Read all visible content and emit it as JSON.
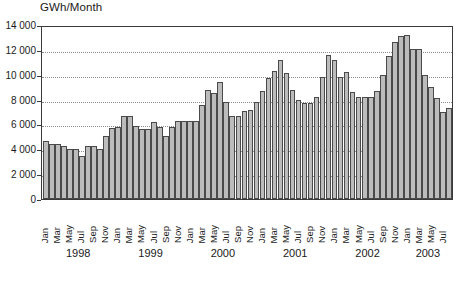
{
  "chart_data": {
    "type": "bar",
    "title": "GWh/Month",
    "xlabel": "",
    "ylabel": "GWh/Month",
    "ylim": [
      0,
      14000
    ],
    "grid": true,
    "legend": null,
    "y_ticks": [
      0,
      2000,
      4000,
      6000,
      8000,
      10000,
      12000,
      14000
    ],
    "y_tick_labels": [
      "0",
      "2 000",
      "4 000",
      "6 000",
      "8 000",
      "10 000",
      "12 000",
      "14 000"
    ],
    "year_labels": [
      "1998",
      "1999",
      "2000",
      "2001",
      "2002",
      "2003"
    ],
    "visible_month_ticks": [
      "Jan",
      "Mar",
      "May",
      "Jul",
      "Sep",
      "Nov"
    ],
    "categories": [
      "Jan 1998",
      "Feb 1998",
      "Mar 1998",
      "Apr 1998",
      "May 1998",
      "Jun 1998",
      "Jul 1998",
      "Aug 1998",
      "Sep 1998",
      "Oct 1998",
      "Nov 1998",
      "Dec 1998",
      "Jan 1999",
      "Feb 1999",
      "Mar 1999",
      "Apr 1999",
      "May 1999",
      "Jun 1999",
      "Jul 1999",
      "Aug 1999",
      "Sep 1999",
      "Oct 1999",
      "Nov 1999",
      "Dec 1999",
      "Jan 2000",
      "Feb 2000",
      "Mar 2000",
      "Apr 2000",
      "May 2000",
      "Jun 2000",
      "Jul 2000",
      "Aug 2000",
      "Sep 2000",
      "Oct 2000",
      "Nov 2000",
      "Dec 2000",
      "Jan 2001",
      "Feb 2001",
      "Mar 2001",
      "Apr 2001",
      "May 2001",
      "Jun 2001",
      "Jul 2001",
      "Aug 2001",
      "Sep 2001",
      "Oct 2001",
      "Nov 2001",
      "Dec 2001",
      "Jan 2002",
      "Feb 2002",
      "Mar 2002",
      "Apr 2002",
      "May 2002",
      "Jun 2002",
      "Jul 2002",
      "Aug 2002",
      "Sep 2002",
      "Oct 2002",
      "Nov 2002",
      "Dec 2002",
      "Jan 2003",
      "Feb 2003",
      "Mar 2003",
      "Apr 2003",
      "May 2003",
      "Jun 2003",
      "Jul 2003",
      "Aug 2003"
    ],
    "values": [
      4700,
      4400,
      4400,
      4300,
      4000,
      4000,
      3500,
      4300,
      4300,
      4000,
      5100,
      5700,
      5800,
      6700,
      6700,
      5900,
      5600,
      5600,
      6200,
      5800,
      5100,
      5800,
      6300,
      6300,
      6300,
      6300,
      7600,
      8800,
      8500,
      9400,
      7800,
      6700,
      6700,
      7100,
      7200,
      7800,
      8700,
      9700,
      10300,
      11200,
      10100,
      8800,
      8000,
      7700,
      7700,
      8200,
      9800,
      11600,
      11200,
      9800,
      10200,
      8600,
      8200,
      8200,
      8200,
      8700,
      10000,
      11500,
      12600,
      13100,
      13200,
      12100,
      12100,
      10000,
      9000,
      8100,
      7000,
      7300
    ],
    "bar_color": "#bcbcbc",
    "bar_border_color": "#4a4a4a",
    "axis_color": "#3a3a3a",
    "gridline_color": "#8d8d8d",
    "background_color": "#ffffff"
  }
}
